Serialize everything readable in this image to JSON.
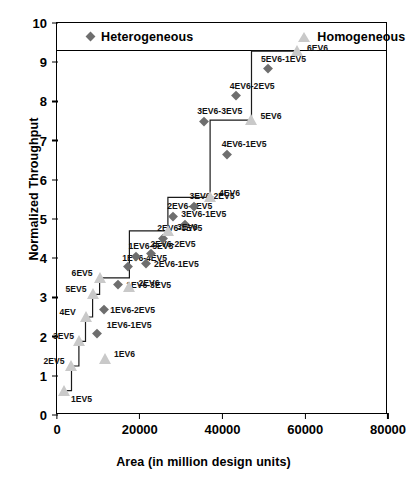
{
  "chart_data": {
    "type": "scatter",
    "title": "",
    "xlabel": "Area (in million design units)",
    "ylabel": "Normalized Throughput",
    "xlim": [
      0,
      80000
    ],
    "ylim": [
      0,
      10
    ],
    "xticks": [
      "0",
      "20000",
      "40000",
      "60000",
      "80000"
    ],
    "yticks": [
      "0",
      "1",
      "2",
      "3",
      "4",
      "5",
      "6",
      "7",
      "8",
      "9",
      "10"
    ],
    "grid": false,
    "legend_position": "top-inside",
    "colors": {
      "heterogeneous": "#6e6e6e",
      "homogeneous": "#c9c9c9",
      "axis": "#000000",
      "stair_line": "#1a1a1a"
    },
    "series": [
      {
        "name": "Heterogeneous",
        "marker": "diamond",
        "color": "#6e6e6e",
        "points": [
          {
            "label": "1EV6-1EV5",
            "x": 9600,
            "y": 2.12,
            "lx": 10,
            "ly": -12
          },
          {
            "label": "1EV6-2EV5",
            "x": 11400,
            "y": 2.73,
            "lx": 6,
            "ly": -3
          },
          {
            "label": "1EV6-3EV5",
            "x": 14800,
            "y": 3.38,
            "lx": 8,
            "ly": -3
          },
          {
            "label": "1EV6-4EV5",
            "x": 17200,
            "y": 3.83,
            "lx": -6,
            "ly": -12
          },
          {
            "label": "1EV6-5EV5",
            "x": 19200,
            "y": 4.1,
            "lx": -8,
            "ly": -13
          },
          {
            "label": "2EV6-1EV5",
            "x": 21500,
            "y": 3.92,
            "lx": 8,
            "ly": -2
          },
          {
            "label": "2EV6-2EV5",
            "x": 22600,
            "y": 4.16,
            "lx": 0,
            "ly": -13
          },
          {
            "label": "2EV6-3EV5",
            "x": 25700,
            "y": 4.56,
            "lx": -6,
            "ly": -13
          },
          {
            "label": "2EV6-4EV5",
            "x": 28100,
            "y": 5.12,
            "lx": -6,
            "ly": -13
          },
          {
            "label": "3EV6-1EV5",
            "x": 31000,
            "y": 4.92,
            "lx": -4,
            "ly": -13
          },
          {
            "label": "3EV6-2EV5",
            "x": 33000,
            "y": 5.37,
            "lx": -4,
            "ly": -13
          },
          {
            "label": "3EV6-3EV5",
            "x": 35600,
            "y": 7.55,
            "lx": -7,
            "ly": -13
          },
          {
            "label": "4EV6-1EV5",
            "x": 41000,
            "y": 6.7,
            "lx": -5,
            "ly": -13
          },
          {
            "label": "4EV6-2EV5",
            "x": 43200,
            "y": 8.2,
            "lx": -6,
            "ly": -13
          },
          {
            "label": "5EV6-1EV5",
            "x": 51000,
            "y": 8.88,
            "lx": -7,
            "ly": -13
          }
        ]
      },
      {
        "name": "Homogeneous",
        "marker": "triangle",
        "color": "#c9c9c9",
        "points": [
          {
            "label": "1EV5",
            "x": 1700,
            "y": 0.62,
            "lx": 7,
            "ly": 3
          },
          {
            "label": "2EV5",
            "x": 3500,
            "y": 1.25,
            "lx": -28,
            "ly": -10
          },
          {
            "label": "3EV5",
            "x": 5300,
            "y": 1.88,
            "lx": -26,
            "ly": -10
          },
          {
            "label": "4EV",
            "x": 6900,
            "y": 2.5,
            "lx": -26,
            "ly": -10
          },
          {
            "label": "5EV5",
            "x": 8600,
            "y": 3.08,
            "lx": -27,
            "ly": -10
          },
          {
            "label": "6EV5",
            "x": 10300,
            "y": 3.5,
            "lx": -28,
            "ly": -10
          },
          {
            "label": "1EV6",
            "x": 11600,
            "y": 1.42,
            "lx": 9,
            "ly": -10
          },
          {
            "label": "2EV6",
            "x": 17500,
            "y": 3.27,
            "lx": 9,
            "ly": -9
          },
          {
            "label": "3EV6",
            "x": 26800,
            "y": 4.7,
            "lx": 9,
            "ly": -9
          },
          {
            "label": "4EV6",
            "x": 37000,
            "y": 5.55,
            "lx": 9,
            "ly": -9
          },
          {
            "label": "5EV6",
            "x": 47000,
            "y": 7.52,
            "lx": 9,
            "ly": -9
          },
          {
            "label": "6EV6",
            "x": 58000,
            "y": 9.28,
            "lx": 10,
            "ly": -8
          }
        ]
      }
    ],
    "stair_path": [
      {
        "x": 1700,
        "y": 0.62
      },
      {
        "x": 3500,
        "y": 0.62
      },
      {
        "x": 3500,
        "y": 1.25
      },
      {
        "x": 5300,
        "y": 1.25
      },
      {
        "x": 5300,
        "y": 1.88
      },
      {
        "x": 6900,
        "y": 1.88
      },
      {
        "x": 6900,
        "y": 2.5
      },
      {
        "x": 8600,
        "y": 2.5
      },
      {
        "x": 8600,
        "y": 3.08
      },
      {
        "x": 10300,
        "y": 3.08
      },
      {
        "x": 10300,
        "y": 3.5
      },
      {
        "x": 17500,
        "y": 3.5
      },
      {
        "x": 17500,
        "y": 4.7
      },
      {
        "x": 26800,
        "y": 4.7
      },
      {
        "x": 26800,
        "y": 5.55
      },
      {
        "x": 37000,
        "y": 5.55
      },
      {
        "x": 37000,
        "y": 7.52
      },
      {
        "x": 47000,
        "y": 7.52
      },
      {
        "x": 47000,
        "y": 9.28
      },
      {
        "x": 58000,
        "y": 9.28
      }
    ]
  },
  "legend": {
    "heterogeneous_label": "Heterogeneous",
    "homogeneous_label": "Homogeneous"
  }
}
